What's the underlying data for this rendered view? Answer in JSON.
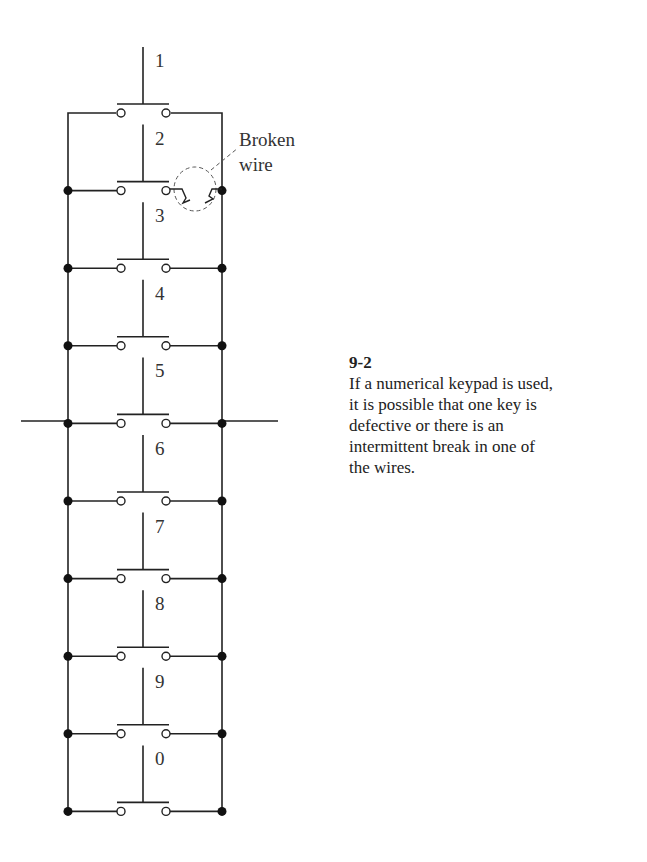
{
  "figure": {
    "number": "9-2",
    "caption": "If a numerical keypad is used, it is possible that one key is defective or there is an intermittent break in one of the wires.",
    "caption_lines": [
      "If a numerical keypad is used,",
      "it is possible that one key is",
      "defective or there is an",
      "intermittent break in one of",
      "the wires."
    ]
  },
  "diagram": {
    "keys": [
      "1",
      "2",
      "3",
      "4",
      "5",
      "6",
      "7",
      "8",
      "9",
      "0"
    ],
    "annotation": {
      "line1": "Broken",
      "line2": "wire"
    }
  }
}
